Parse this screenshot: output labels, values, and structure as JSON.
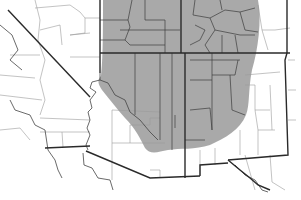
{
  "map": {
    "title": "",
    "subject": "Species range map over southwestern United States",
    "region_fill_color": "#a4a4a4",
    "state_border_color": "#2a2a2a",
    "county_border_color": "#9a9a9a",
    "background_color": "#ffffff",
    "labels": []
  }
}
